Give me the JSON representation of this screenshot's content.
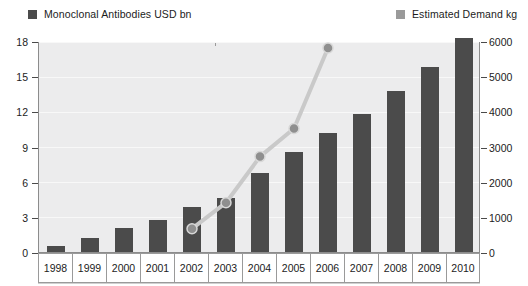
{
  "legend": {
    "items": [
      {
        "label": "Monoclonal Antibodies USD bn",
        "color": "#4b4b4b",
        "icon": "square-swatch"
      },
      {
        "label": "Estimated Demand kg",
        "color": "#9a9a9a",
        "icon": "square-swatch"
      }
    ]
  },
  "chart_data": {
    "type": "bar",
    "title": "",
    "xlabel": "",
    "ylabel": "",
    "grid": true,
    "legend_position": "top",
    "categories": [
      "1998",
      "1999",
      "2000",
      "2001",
      "2002",
      "2003",
      "2004",
      "2005",
      "2006",
      "2007",
      "2008",
      "2009",
      "2010"
    ],
    "axes": {
      "left": {
        "name": "Monoclonal Antibodies USD bn",
        "ticks": [
          "0",
          "3",
          "6",
          "9",
          "12",
          "15",
          "18"
        ],
        "tick_values": [
          0,
          3,
          6,
          9,
          12,
          15,
          18
        ],
        "ylim": [
          0,
          18
        ]
      },
      "right": {
        "name": "Estimated Demand kg",
        "ticks": [
          "0",
          "1000",
          "2000",
          "3000",
          "4000",
          "5000",
          "6000"
        ],
        "tick_values": [
          0,
          1000,
          2000,
          3000,
          4000,
          5000,
          6000
        ],
        "ylim": [
          0,
          6000
        ]
      }
    },
    "series": [
      {
        "name": "Monoclonal Antibodies USD bn",
        "chart_type": "bar",
        "axis": "left",
        "color": "#4b4b4b",
        "x": [
          "1998",
          "1999",
          "2000",
          "2001",
          "2002",
          "2003",
          "2004",
          "2005",
          "2006",
          "2007",
          "2008",
          "2009",
          "2010"
        ],
        "values": [
          0.6,
          1.3,
          2.1,
          2.8,
          3.9,
          4.7,
          6.8,
          8.6,
          10.2,
          11.9,
          13.8,
          15.9,
          18.3
        ]
      },
      {
        "name": "Estimated Demand kg",
        "chart_type": "line",
        "axis": "right",
        "color": "#c9c9c9",
        "marker_color": "#8f8f8f",
        "x": [
          "2002",
          "2003",
          "2004",
          "2005",
          "2006"
        ],
        "values": [
          690,
          1430,
          2740,
          3540,
          5830
        ]
      }
    ]
  }
}
